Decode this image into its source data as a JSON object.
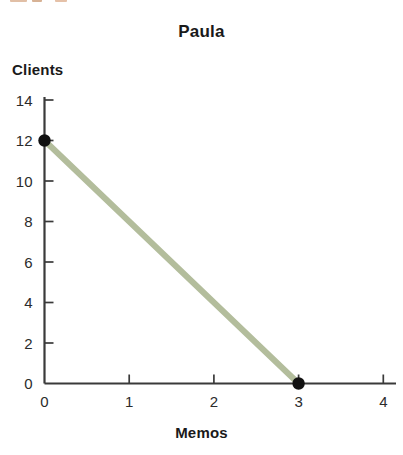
{
  "chart_data": {
    "type": "line",
    "title": "Paula",
    "xlabel": "Memos",
    "ylabel": "Clients",
    "xlim": [
      0,
      4.2
    ],
    "ylim": [
      0,
      14.6
    ],
    "xticks": [
      0,
      1,
      2,
      3,
      4
    ],
    "xticklabels": [
      "0",
      "1",
      "2",
      "3",
      "4"
    ],
    "yticks": [
      0,
      2,
      4,
      6,
      8,
      10,
      12,
      14
    ],
    "yticklabels": [
      "0",
      "2",
      "4",
      "6",
      "8",
      "10",
      "12",
      "14"
    ],
    "grid": false,
    "legend": false,
    "line_color": "#b3bd9c",
    "line_width": 6,
    "marker_color": "#111111",
    "axis_color": "#3a3a3a",
    "background": "#ffffff",
    "series": [
      {
        "name": "Paula production possibilities frontier",
        "x": [
          0,
          3
        ],
        "y": [
          12,
          0
        ],
        "markers": [
          {
            "x": 0,
            "y": 12
          },
          {
            "x": 3,
            "y": 0
          }
        ]
      }
    ]
  },
  "figure": {
    "title": "Paula",
    "y_axis_title": "Clients",
    "x_axis_title": "Memos"
  }
}
